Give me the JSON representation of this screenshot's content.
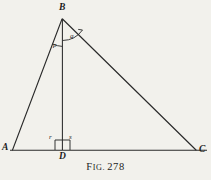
{
  "figure": {
    "caption_prefix_lead": "F",
    "caption_prefix_rest": "IG.",
    "caption_number": "278",
    "background_color": "#f2f1ec",
    "ink_color": "#1b1b1b"
  },
  "vertices": [
    {
      "id": "A",
      "label": "A",
      "x": 12,
      "y": 150
    },
    {
      "id": "B",
      "label": "B",
      "x": 62,
      "y": 18
    },
    {
      "id": "C",
      "label": "C",
      "x": 196,
      "y": 150
    },
    {
      "id": "D",
      "label": "D",
      "x": 62,
      "y": 150
    }
  ],
  "segments": [
    {
      "name": "side-AB",
      "from": "A",
      "to": "B"
    },
    {
      "name": "side-BC",
      "from": "B",
      "to": "C"
    },
    {
      "name": "base-AC",
      "from": "A",
      "to": "C"
    },
    {
      "name": "altitude-BD",
      "from": "B",
      "to": "D"
    }
  ],
  "angles": [
    {
      "id": "p",
      "label": "p",
      "at": "B",
      "side": "left",
      "arc": "M 53.4 44.6 A 27 27 0 0 0 62.5 46.0"
    },
    {
      "id": "q",
      "label": "q",
      "at": "B",
      "side": "right",
      "arc": "M 62.5 40.0 A 23 23 0 0 0 81.0 31.0"
    },
    {
      "id": "r",
      "label": "r",
      "at": "D",
      "side": "left",
      "arc": ""
    },
    {
      "id": "s",
      "label": "s",
      "at": "D",
      "side": "right",
      "arc": ""
    }
  ],
  "right_angle_box": {
    "name": "right-angle-marker",
    "x": 55,
    "y": 140,
    "width": 15,
    "height": 10
  },
  "base_line": {
    "y": 150,
    "x_start": 10,
    "x_end": 207
  }
}
